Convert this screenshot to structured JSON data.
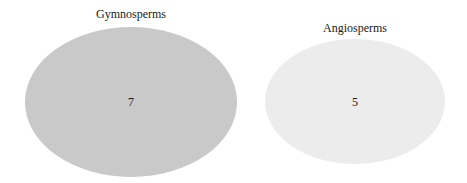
{
  "diagram": {
    "type": "venn",
    "sets": [
      {
        "label": "Gymnosperms",
        "count": "7",
        "fill": "#c9c9c9"
      },
      {
        "label": "Angiosperms",
        "count": "5",
        "fill": "#ececec"
      }
    ]
  }
}
